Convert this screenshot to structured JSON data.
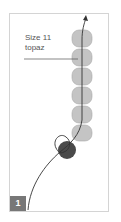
{
  "diagram": {
    "label_line1": "Size 11",
    "label_line2": "topaz",
    "step_number": "1",
    "colors": {
      "bead_light": "#c4c4c4",
      "bead_dark": "#4a4a4a",
      "thread": "#333333",
      "frame": "#d4d4d4",
      "step_badge": "#777777"
    },
    "bead_count": 6
  }
}
